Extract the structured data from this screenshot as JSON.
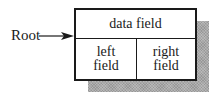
{
  "diagram": {
    "type": "tree-node-structure",
    "root_label": "Root",
    "node": {
      "data_field": "data field",
      "left_field": {
        "line1": "left",
        "line2": "field"
      },
      "right_field": {
        "line1": "right",
        "line2": "field"
      }
    },
    "colors": {
      "stroke": "#1a1a1a",
      "shadow": "#a8a8a8",
      "background": "#ffffff"
    }
  }
}
